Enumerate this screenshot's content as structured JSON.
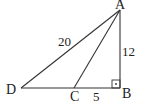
{
  "diagram": {
    "type": "triangle",
    "points": {
      "A": {
        "label": "A"
      },
      "B": {
        "label": "B"
      },
      "C": {
        "label": "C"
      },
      "D": {
        "label": "D"
      }
    },
    "segments": [
      {
        "from": "A",
        "to": "D",
        "length_label": "20"
      },
      {
        "from": "A",
        "to": "B",
        "length_label": "12"
      },
      {
        "from": "C",
        "to": "B",
        "length_label": "5"
      },
      {
        "from": "A",
        "to": "C",
        "length_label": ""
      },
      {
        "from": "D",
        "to": "C",
        "length_label": ""
      }
    ],
    "right_angle_at": "B",
    "colors": {
      "stroke": "#333333",
      "background": "#ffffff"
    }
  }
}
